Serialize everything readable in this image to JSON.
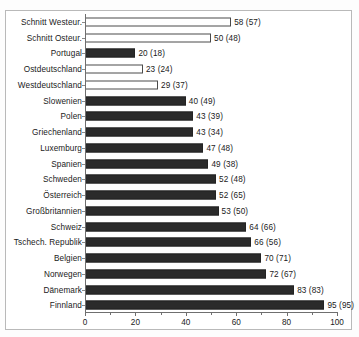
{
  "chart_data": {
    "type": "bar",
    "orientation": "horizontal",
    "title": "",
    "xlabel": "",
    "ylabel": "",
    "xlim": [
      0,
      100
    ],
    "grid": false,
    "legend": null,
    "xticks": [
      0,
      20,
      40,
      60,
      80,
      100
    ],
    "xtick_labels": [
      "0",
      "20",
      "40",
      "60",
      "80",
      "100"
    ],
    "categories": [
      "Schnitt Westeur.",
      "Schnitt Osteur.",
      "Portugal",
      "Ostdeutschland",
      "Westdeutschland",
      "Slowenien",
      "Polen",
      "Griechenland",
      "Luxemburg",
      "Spanien",
      "Schweden",
      "Österreich",
      "Großbritannien",
      "Schweiz",
      "Tschech. Republik",
      "Belgien",
      "Norwegen",
      "Dänemark",
      "Finnland"
    ],
    "values": [
      58,
      50,
      20,
      23,
      29,
      40,
      43,
      43,
      47,
      49,
      52,
      52,
      53,
      64,
      66,
      70,
      72,
      83,
      95
    ],
    "prior_values": [
      57,
      48,
      18,
      24,
      37,
      49,
      39,
      34,
      48,
      38,
      48,
      65,
      50,
      66,
      56,
      71,
      67,
      83,
      95
    ],
    "data_labels": [
      "58 (57)",
      "50 (48)",
      "20 (18)",
      "23 (24)",
      "29 (37)",
      "40 (49)",
      "43 (39)",
      "43 (34)",
      "47 (48)",
      "49 (38)",
      "52 (48)",
      "52 (65)",
      "53 (50)",
      "64 (66)",
      "66 (56)",
      "70 (71)",
      "72 (67)",
      "83 (83)",
      "95 (95)"
    ],
    "bar_styles": [
      "hollow",
      "hollow",
      "solid",
      "hollow",
      "hollow",
      "solid",
      "solid",
      "solid",
      "solid",
      "solid",
      "solid",
      "solid",
      "solid",
      "solid",
      "solid",
      "solid",
      "solid",
      "solid",
      "solid"
    ],
    "colors": {
      "solid_fill": "#2b2b2b",
      "hollow_fill": "#ffffff",
      "bar_outline": "#4a4a4a",
      "axis": "#6f6f6f",
      "text": "#1a1a1a",
      "frame": "#b9b9b9",
      "background": "#ffffff"
    }
  }
}
